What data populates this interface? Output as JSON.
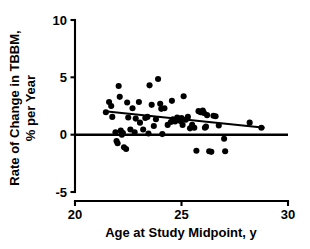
{
  "chart_data": {
    "type": "scatter",
    "title": "",
    "xlabel": "Age at Study Midpoint, y",
    "ylabel": "Rate of Change in TBBM, % per Year",
    "ylabel_line1": "Rate of Change in TBBM,",
    "ylabel_line2": "% per Year",
    "xlim": [
      20,
      30
    ],
    "ylim": [
      -5,
      10
    ],
    "xticks": [
      20,
      25,
      30
    ],
    "xtick_labels": [
      "20",
      "25",
      "30"
    ],
    "yticks": [
      -5,
      0,
      5,
      10
    ],
    "ytick_labels": [
      "-5",
      "0",
      "5",
      "10"
    ],
    "grid": false,
    "legend": null,
    "marker": "filled-circle",
    "marker_color": "#000000",
    "zero_reference_line": {
      "y": 0,
      "x_start": 20,
      "x_end": 30,
      "color": "#000000"
    },
    "regression_line": {
      "label": "least-squares fit",
      "x_start": 21.4,
      "y_start": 2.05,
      "x_end": 28.9,
      "y_end": 0.6,
      "color": "#000000"
    },
    "points": [
      {
        "x": 21.45,
        "y": 1.95
      },
      {
        "x": 21.6,
        "y": 2.85
      },
      {
        "x": 21.7,
        "y": 2.5
      },
      {
        "x": 21.75,
        "y": 1.55
      },
      {
        "x": 21.9,
        "y": 0.2
      },
      {
        "x": 21.95,
        "y": -0.55
      },
      {
        "x": 22.0,
        "y": -0.75
      },
      {
        "x": 22.05,
        "y": 4.25
      },
      {
        "x": 22.1,
        "y": 3.3
      },
      {
        "x": 22.15,
        "y": 0.35
      },
      {
        "x": 22.2,
        "y": 0.0
      },
      {
        "x": 22.25,
        "y": 0.15
      },
      {
        "x": 22.3,
        "y": -1.1
      },
      {
        "x": 22.4,
        "y": -1.25
      },
      {
        "x": 22.45,
        "y": 2.8
      },
      {
        "x": 22.5,
        "y": 1.5
      },
      {
        "x": 22.6,
        "y": 0.45
      },
      {
        "x": 22.7,
        "y": 2.3
      },
      {
        "x": 22.8,
        "y": 0.2
      },
      {
        "x": 22.85,
        "y": 1.4
      },
      {
        "x": 23.0,
        "y": 2.85
      },
      {
        "x": 23.05,
        "y": 1.05
      },
      {
        "x": 23.2,
        "y": 0.45
      },
      {
        "x": 23.3,
        "y": 1.45
      },
      {
        "x": 23.4,
        "y": 1.55
      },
      {
        "x": 23.45,
        "y": 0.1
      },
      {
        "x": 23.5,
        "y": 4.3
      },
      {
        "x": 23.6,
        "y": 2.6
      },
      {
        "x": 23.7,
        "y": 0.75
      },
      {
        "x": 23.8,
        "y": 1.35
      },
      {
        "x": 23.9,
        "y": 4.85
      },
      {
        "x": 24.0,
        "y": 2.7
      },
      {
        "x": 24.05,
        "y": 2.25
      },
      {
        "x": 24.1,
        "y": 0.05
      },
      {
        "x": 24.2,
        "y": 2.3
      },
      {
        "x": 24.35,
        "y": 0.85
      },
      {
        "x": 24.5,
        "y": 1.1
      },
      {
        "x": 24.55,
        "y": 2.95
      },
      {
        "x": 24.6,
        "y": 1.35
      },
      {
        "x": 24.7,
        "y": 1.15
      },
      {
        "x": 24.8,
        "y": 1.5
      },
      {
        "x": 24.9,
        "y": 1.35
      },
      {
        "x": 24.95,
        "y": 1.2
      },
      {
        "x": 25.0,
        "y": 1.45
      },
      {
        "x": 25.05,
        "y": 0.85
      },
      {
        "x": 25.1,
        "y": 3.35
      },
      {
        "x": 25.2,
        "y": 1.3
      },
      {
        "x": 25.3,
        "y": 1.55
      },
      {
        "x": 25.4,
        "y": 0.55
      },
      {
        "x": 25.5,
        "y": 0.85
      },
      {
        "x": 25.6,
        "y": 0.6
      },
      {
        "x": 25.7,
        "y": -1.4
      },
      {
        "x": 25.8,
        "y": 2.05
      },
      {
        "x": 25.9,
        "y": 1.95
      },
      {
        "x": 26.0,
        "y": 2.1
      },
      {
        "x": 26.05,
        "y": 1.9
      },
      {
        "x": 26.1,
        "y": 0.6
      },
      {
        "x": 26.15,
        "y": 0.7
      },
      {
        "x": 26.2,
        "y": 1.7
      },
      {
        "x": 26.3,
        "y": -1.45
      },
      {
        "x": 26.4,
        "y": -1.5
      },
      {
        "x": 26.5,
        "y": 1.65
      },
      {
        "x": 26.6,
        "y": 1.6
      },
      {
        "x": 26.75,
        "y": 0.8
      },
      {
        "x": 27.0,
        "y": -0.35
      },
      {
        "x": 27.05,
        "y": -1.45
      },
      {
        "x": 28.2,
        "y": 1.05
      },
      {
        "x": 28.75,
        "y": 0.6
      }
    ]
  }
}
